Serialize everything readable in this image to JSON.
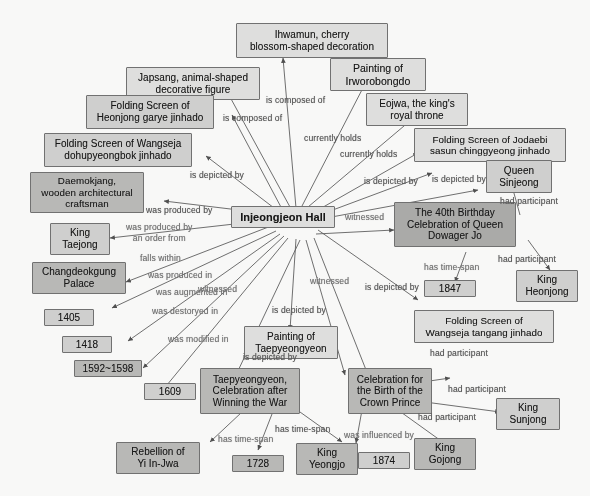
{
  "graph": {
    "title": "Injeongjeon Hall knowledge graph",
    "center": {
      "label": "Injeongjeon Hall"
    },
    "nodes": [
      {
        "id": "ihwamun",
        "label": "Ihwamun, cherry\nblossom-shaped decoration"
      },
      {
        "id": "irworobongdo",
        "label": "Painting of\nIrworobongdo"
      },
      {
        "id": "japsang",
        "label": "Japsang, animal-shaped\ndecorative figure"
      },
      {
        "id": "eojwa",
        "label": "Eojwa, the king's\nroyal throne"
      },
      {
        "id": "heonjong_garye",
        "label": "Folding Screen of\nHeonjong garye jinhado"
      },
      {
        "id": "jodaebi",
        "label": "Folding Screen of Jodaebi\nsasun chinggyeong jinhado"
      },
      {
        "id": "wangseja_dohu",
        "label": "Folding Screen of Wangseja\ndohupyeongbok jinhado"
      },
      {
        "id": "queen_sinjeong",
        "label": "Queen\nSinjeong"
      },
      {
        "id": "daemokjang",
        "label": "Daemokjang,\nwooden architectural\ncraftsman"
      },
      {
        "id": "birthday40",
        "label": "The 40th Birthday\nCelebration of Queen\nDowager Jo"
      },
      {
        "id": "king_taejong",
        "label": "King\nTaejong"
      },
      {
        "id": "changdeokgung",
        "label": "Changdeokgung\nPalace"
      },
      {
        "id": "y1847",
        "label": "1847"
      },
      {
        "id": "king_heonjong",
        "label": "King\nHeonjong"
      },
      {
        "id": "y1405",
        "label": "1405"
      },
      {
        "id": "y1418",
        "label": "1418"
      },
      {
        "id": "wangseja_tang",
        "label": "Folding Screen of\nWangseja tangang jinhado"
      },
      {
        "id": "y1592",
        "label": "1592~1598"
      },
      {
        "id": "taepyeong_ptg",
        "label": "Painting of\nTaepyeongyeon"
      },
      {
        "id": "y1609",
        "label": "1609"
      },
      {
        "id": "taepyeongyeon",
        "label": "Taepyeongyeon,\nCelebration after\nWinning the War"
      },
      {
        "id": "crown_prince",
        "label": "Celebration for\nthe Birth of the\nCrown Prince"
      },
      {
        "id": "king_sunjong",
        "label": "King\nSunjong"
      },
      {
        "id": "rebellion",
        "label": "Rebellion of\nYi In-Jwa"
      },
      {
        "id": "y1728",
        "label": "1728"
      },
      {
        "id": "king_yeongjo",
        "label": "King\nYeongjo"
      },
      {
        "id": "king_gojong",
        "label": "King\nGojong"
      },
      {
        "id": "y1874",
        "label": "1874"
      }
    ],
    "edge_labels": [
      {
        "id": "el_composed_1",
        "text": "is composed of"
      },
      {
        "id": "el_composed_2",
        "text": "is composed of"
      },
      {
        "id": "el_holds_1",
        "text": "currently holds"
      },
      {
        "id": "el_holds_2",
        "text": "currently holds"
      },
      {
        "id": "el_depicted_1",
        "text": "is depicted by"
      },
      {
        "id": "el_depicted_2",
        "text": "is depicted by"
      },
      {
        "id": "el_depicted_3",
        "text": "is depicted by"
      },
      {
        "id": "el_produced_by",
        "text": "was produced by"
      },
      {
        "id": "el_order_from",
        "text": "was produced by\nan order from"
      },
      {
        "id": "el_falls_within",
        "text": "falls within"
      },
      {
        "id": "el_produced_in",
        "text": "was produced in"
      },
      {
        "id": "el_augmented_in",
        "text": "was augmented in"
      },
      {
        "id": "el_destroyed_in",
        "text": "was destoryed in"
      },
      {
        "id": "el_modified_in",
        "text": "was modified in"
      },
      {
        "id": "el_witnessed_1",
        "text": "witnessed"
      },
      {
        "id": "el_witnessed_2",
        "text": "witnessed"
      },
      {
        "id": "el_witnessed_3",
        "text": "witnessed"
      },
      {
        "id": "el_depicted_4",
        "text": "is depicted by"
      },
      {
        "id": "el_depicted_5",
        "text": "is depicted by"
      },
      {
        "id": "el_depicted_6",
        "text": "is depicted by"
      },
      {
        "id": "el_participant_1",
        "text": "had participant"
      },
      {
        "id": "el_participant_2",
        "text": "had participant"
      },
      {
        "id": "el_participant_3",
        "text": "had participant"
      },
      {
        "id": "el_participant_4",
        "text": "had participant"
      },
      {
        "id": "el_participant_5",
        "text": "had participant"
      },
      {
        "id": "el_timespan_1",
        "text": "has time-span"
      },
      {
        "id": "el_timespan_2",
        "text": "has time-span"
      },
      {
        "id": "el_timespan_3",
        "text": "has time-span"
      },
      {
        "id": "el_influenced",
        "text": "was influenced by"
      }
    ],
    "colors": {
      "node_border": "#6d6d6d",
      "node_fill_light": "#e2e2e0",
      "node_fill_dark": "#aaaaa8",
      "edge_stroke": "#5a5a5a",
      "edge_label_text": "#4f4f4f"
    }
  }
}
